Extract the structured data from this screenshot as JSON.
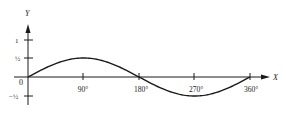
{
  "chart_data": {
    "type": "line",
    "title": "",
    "xlabel": "X",
    "ylabel": "Y",
    "x_ticks": [
      "90°",
      "180°",
      "270°",
      "360°"
    ],
    "y_ticks": [
      "1",
      "½",
      "−½"
    ],
    "origin_label": "0",
    "xlim": [
      0,
      360
    ],
    "ylim": [
      -0.5,
      1
    ],
    "grid": false,
    "legend": null,
    "series": [
      {
        "name": "y = ½ sin x",
        "x": [
          0,
          45,
          90,
          135,
          180,
          225,
          270,
          315,
          360
        ],
        "values": [
          0,
          0.354,
          0.5,
          0.354,
          0,
          -0.354,
          -0.5,
          -0.354,
          0
        ]
      }
    ]
  }
}
